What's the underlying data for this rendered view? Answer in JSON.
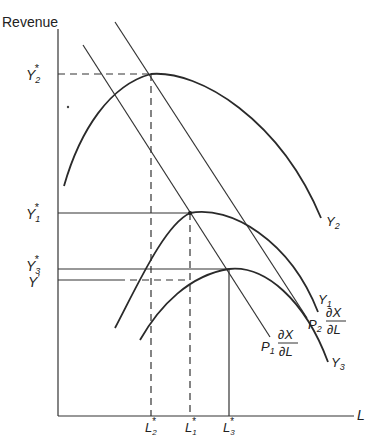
{
  "diagram": {
    "y_axis_label": "Revenue",
    "x_axis_label": "L",
    "y_ticks": {
      "y2_star": {
        "base": "Y",
        "sub": "2",
        "sup": "*"
      },
      "y1_star": {
        "base": "Y",
        "sub": "1",
        "sup": "*"
      },
      "y3_star": {
        "base": "Y",
        "sub": "3",
        "sup": "*"
      },
      "y_prime": {
        "base": "Y",
        "sup": "′"
      }
    },
    "x_ticks": {
      "l2_star": {
        "base": "L",
        "sub": "2",
        "sup": "*"
      },
      "l1_star": {
        "base": "L",
        "sub": "1",
        "sup": "*"
      },
      "l3_star": {
        "base": "L",
        "sub": "3",
        "sup": "*"
      }
    },
    "curves": {
      "y2": {
        "base": "Y",
        "sub": "2"
      },
      "y1": {
        "base": "Y",
        "sub": "1"
      },
      "y3": {
        "base": "Y",
        "sub": "3"
      }
    },
    "price_lines": {
      "p1": {
        "base": "P",
        "sub": "1",
        "num": "∂X",
        "den": "∂L"
      },
      "p2": {
        "base": "P",
        "sub": "2",
        "num": "∂X",
        "den": "∂L"
      }
    }
  }
}
